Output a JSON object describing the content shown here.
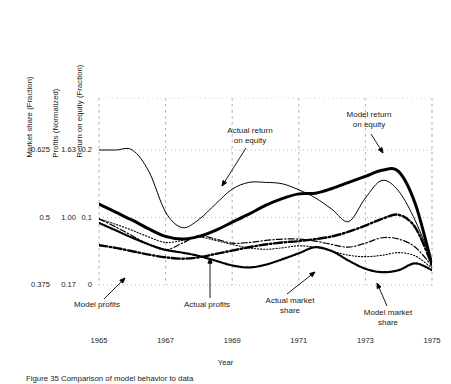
{
  "figure": {
    "caption": "Figure 35  Comparison of model behavior to data",
    "xlabel": "Year",
    "y_axis_titles": {
      "market_share": "Market share (Fraction)",
      "profits": "Profits (Normalized)",
      "roe": "Return on equity (Fraction)"
    },
    "y_ticks": {
      "market_share": [
        "0.625",
        "0.5",
        "0.375"
      ],
      "profits": [
        "1.63",
        "1.00",
        "0.17"
      ],
      "roe": [
        "0.2",
        "0.1",
        "0"
      ]
    },
    "x_ticks": [
      "1965",
      "1967",
      "1969",
      "1971",
      "1973",
      "1975"
    ],
    "annotations": {
      "actual_roe": "Actual return\non equity",
      "model_roe": "Model return\non equity",
      "model_profits": "Model profits",
      "actual_profits": "Actual profits",
      "actual_share": "Actual market\nshare",
      "model_share": "Model market\nshare"
    }
  },
  "chart_data": {
    "type": "line",
    "title": "",
    "xlabel": "Year",
    "ylabel": "Return on equity (Fraction)",
    "xlim": [
      1965,
      1975
    ],
    "ylim": [
      0,
      0.2
    ],
    "grid": true,
    "legend": "in-plot annotations with leader lines",
    "axes": [
      {
        "name": "Market share (Fraction)",
        "ticks": [
          0.375,
          0.5,
          0.625
        ]
      },
      {
        "name": "Profits (Normalized)",
        "ticks": [
          0.17,
          1.0,
          1.63
        ]
      },
      {
        "name": "Return on equity (Fraction)",
        "ticks": [
          0,
          0.1,
          0.2
        ]
      }
    ],
    "x": [
      1965,
      1965.5,
      1966,
      1966.5,
      1967,
      1967.5,
      1968,
      1968.5,
      1969,
      1969.5,
      1970,
      1970.5,
      1971,
      1971.5,
      1972,
      1972.5,
      1973,
      1973.5,
      1974,
      1974.5,
      1975
    ],
    "series": [
      {
        "name": "Model return on equity",
        "style": "thick-solid",
        "color": "#000000",
        "values": [
          0.12,
          0.108,
          0.096,
          0.083,
          0.072,
          0.068,
          0.072,
          0.081,
          0.093,
          0.105,
          0.118,
          0.128,
          0.135,
          0.136,
          0.143,
          0.152,
          0.161,
          0.17,
          0.168,
          0.12,
          0.03
        ]
      },
      {
        "name": "Actual return on equity",
        "style": "thin-solid",
        "color": "#000000",
        "values": [
          0.2,
          0.2,
          0.2,
          0.168,
          0.108,
          0.085,
          0.097,
          0.12,
          0.142,
          0.152,
          0.152,
          0.15,
          0.141,
          0.129,
          0.112,
          0.094,
          0.129,
          0.155,
          0.139,
          0.095,
          0.035
        ]
      },
      {
        "name": "Model profits",
        "style": "dash-dot-thick",
        "color": "#000000",
        "values": [
          0.059,
          0.055,
          0.05,
          0.045,
          0.041,
          0.039,
          0.041,
          0.046,
          0.051,
          0.056,
          0.06,
          0.063,
          0.065,
          0.068,
          0.072,
          0.079,
          0.088,
          0.098,
          0.104,
          0.085,
          0.03
        ]
      },
      {
        "name": "Actual profits",
        "style": "dash-dot-thin",
        "color": "#000000",
        "values": [
          0.098,
          0.086,
          0.073,
          0.06,
          0.052,
          0.062,
          0.073,
          0.068,
          0.062,
          0.063,
          0.066,
          0.068,
          0.068,
          0.065,
          0.06,
          0.056,
          0.062,
          0.07,
          0.068,
          0.056,
          0.028
        ]
      },
      {
        "name": "Actual market share",
        "style": "dotted-fine",
        "color": "#000000",
        "values": [
          0.098,
          0.09,
          0.081,
          0.071,
          0.063,
          0.066,
          0.071,
          0.066,
          0.06,
          0.055,
          0.053,
          0.055,
          0.058,
          0.056,
          0.05,
          0.044,
          0.042,
          0.044,
          0.048,
          0.043,
          0.025
        ]
      },
      {
        "name": "Model market share",
        "style": "dotted-bold",
        "color": "#000000",
        "values": [
          0.092,
          0.081,
          0.07,
          0.06,
          0.052,
          0.048,
          0.043,
          0.036,
          0.029,
          0.026,
          0.03,
          0.038,
          0.047,
          0.056,
          0.05,
          0.036,
          0.024,
          0.019,
          0.022,
          0.032,
          0.022
        ]
      }
    ]
  }
}
